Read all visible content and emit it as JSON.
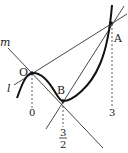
{
  "diagram": {
    "type": "function-graph-with-tangent-lines",
    "points": {
      "O": {
        "label": "O",
        "x_value": "0"
      },
      "B": {
        "label": "B",
        "x_value": "3/2",
        "x_num": "3",
        "x_den": "2"
      },
      "A": {
        "label": "A",
        "x_value": "3"
      }
    },
    "lines": {
      "m": {
        "label": "m",
        "description": "line through O and B"
      },
      "l": {
        "label": "l",
        "description": "line through O and A"
      },
      "BA": {
        "description": "line through B and A"
      }
    },
    "ticks": [
      "0",
      "3/2",
      "3"
    ],
    "colors": {
      "stroke": "#222222",
      "curve": "#111111",
      "background": "#ffffff"
    }
  }
}
